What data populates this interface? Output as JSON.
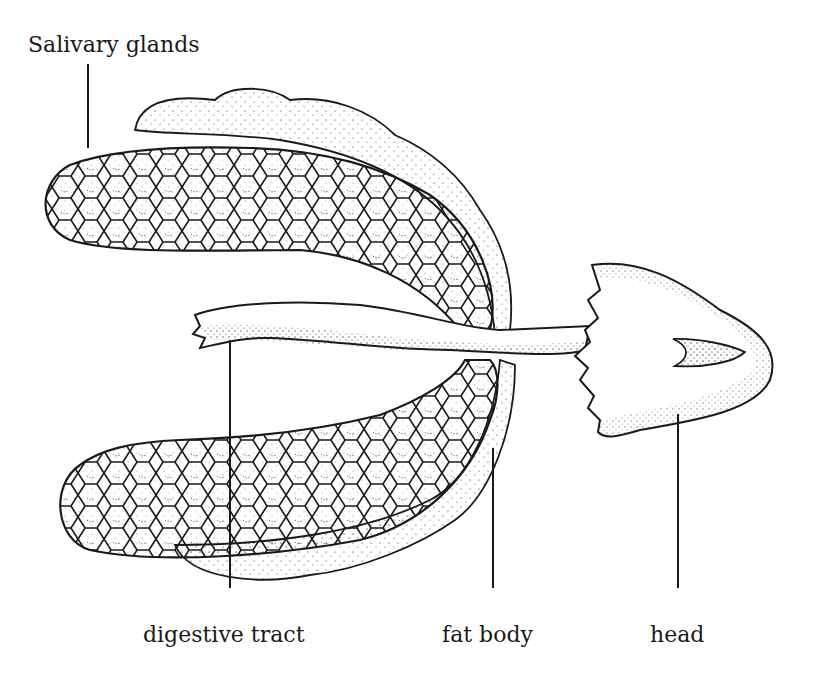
{
  "diagram": {
    "colors": {
      "ink": "#1a1a1a",
      "background": "#ffffff",
      "stipple": "#2a2a2a"
    },
    "labels": {
      "salivary_glands": "Salivary glands",
      "digestive_tract": "digestive tract",
      "fat_body": "fat body",
      "head": "head"
    },
    "parts": [
      {
        "id": "upper-salivary-gland",
        "label_ref": "salivary_glands"
      },
      {
        "id": "lower-salivary-gland",
        "label_ref": "salivary_glands"
      },
      {
        "id": "digestive-tract",
        "label_ref": "digestive_tract"
      },
      {
        "id": "fat-body",
        "label_ref": "fat_body"
      },
      {
        "id": "head",
        "label_ref": "head"
      }
    ]
  }
}
